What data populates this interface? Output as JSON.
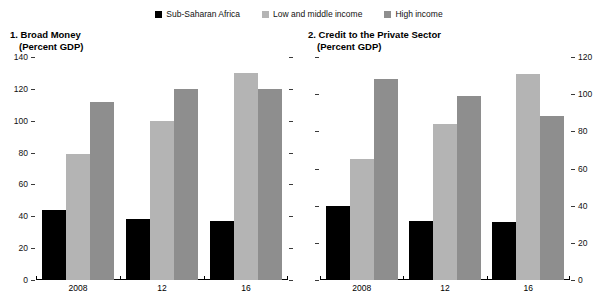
{
  "legend": {
    "items": [
      {
        "label": "Sub-Saharan Africa",
        "color": "#000000"
      },
      {
        "label": "Low and middle income",
        "color": "#b4b4b4"
      },
      {
        "label": "High income",
        "color": "#8e8e8e"
      }
    ]
  },
  "panels": [
    {
      "title": "1. Broad Money",
      "subtitle": "(Percent GDP)",
      "axis_side": "left"
    },
    {
      "title": "2. Credit to the Private Sector",
      "subtitle": "(Percent GDP)",
      "axis_side": "right"
    }
  ],
  "chart_data": [
    {
      "type": "bar",
      "title": "1. Broad Money",
      "subtitle": "(Percent GDP)",
      "xlabel": "",
      "ylabel": "Percent GDP",
      "ylim": [
        0,
        140
      ],
      "yticks": [
        0,
        20,
        40,
        60,
        80,
        100,
        120,
        140
      ],
      "grid": false,
      "legend_position": "top-center",
      "axis_side": "left",
      "categories": [
        "2008",
        "12",
        "16"
      ],
      "series": [
        {
          "name": "Sub-Saharan Africa",
          "color": "#000000",
          "values": [
            44,
            38,
            37
          ]
        },
        {
          "name": "Low and middle income",
          "color": "#b4b4b4",
          "values": [
            79,
            100,
            130
          ]
        },
        {
          "name": "High income",
          "color": "#8e8e8e",
          "values": [
            112,
            120,
            120
          ]
        }
      ]
    },
    {
      "type": "bar",
      "title": "2. Credit to the Private Sector",
      "subtitle": "(Percent GDP)",
      "xlabel": "",
      "ylabel": "Percent GDP",
      "ylim": [
        0,
        120
      ],
      "yticks": [
        0,
        20,
        40,
        60,
        80,
        100,
        120
      ],
      "grid": false,
      "legend_position": "top-center",
      "axis_side": "right",
      "categories": [
        "2008",
        "12",
        "16"
      ],
      "series": [
        {
          "name": "Sub-Saharan Africa",
          "color": "#000000",
          "values": [
            40,
            32,
            31
          ]
        },
        {
          "name": "Low and middle income",
          "color": "#b4b4b4",
          "values": [
            65,
            84,
            111
          ]
        },
        {
          "name": "High income",
          "color": "#8e8e8e",
          "values": [
            108,
            99,
            88
          ]
        }
      ]
    }
  ]
}
